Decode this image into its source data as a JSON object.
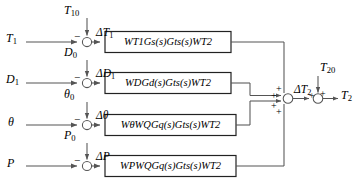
{
  "diagram": {
    "line_color": "#555555",
    "box_border_color": "#222222",
    "text_color": "#000000",
    "rows": [
      {
        "id": "row-t1",
        "input_label": "T",
        "input_sub": "1",
        "reference_label": "T",
        "reference_sub": "10",
        "reference_sign": "−",
        "error_label": "ΔT",
        "error_sub": "1",
        "block_text": "W",
        "block_full": "W T1 G s(s) G ts(s) W T2",
        "block_tokens": [
          {
            "t": "W",
            "s": "T1"
          },
          {
            "t": "G",
            "s": "s"
          },
          {
            "t": "(s)",
            "s": ""
          },
          {
            "t": "G",
            "s": "ts"
          },
          {
            "t": "(s)",
            "s": ""
          },
          {
            "t": "W",
            "s": "T2"
          }
        ],
        "junction_sign_into_sum": "+"
      },
      {
        "id": "row-d1",
        "input_label": "D",
        "input_sub": "1",
        "reference_label": "D",
        "reference_sub": "0",
        "reference_sign": "−",
        "error_label": "ΔD",
        "error_sub": "1",
        "block_full": "W D G d(s) G ts(s) W T2",
        "block_tokens": [
          {
            "t": "W",
            "s": "D"
          },
          {
            "t": "G",
            "s": "d"
          },
          {
            "t": "(s)",
            "s": ""
          },
          {
            "t": "G",
            "s": "ts"
          },
          {
            "t": "(s)",
            "s": ""
          },
          {
            "t": "W",
            "s": "T2"
          }
        ],
        "junction_sign_into_sum": "+"
      },
      {
        "id": "row-theta",
        "input_label": "θ",
        "input_sub": "",
        "reference_label": "θ",
        "reference_sub": "0",
        "reference_sign": "−",
        "error_label": "Δθ",
        "error_sub": "",
        "block_full": "W θ W Q G q(s) G ts(s) W T2",
        "block_tokens": [
          {
            "t": "W",
            "s": "θ"
          },
          {
            "t": "W",
            "s": "Q"
          },
          {
            "t": "G",
            "s": "q"
          },
          {
            "t": "(s)",
            "s": ""
          },
          {
            "t": "G",
            "s": "ts"
          },
          {
            "t": "(s)",
            "s": ""
          },
          {
            "t": "W",
            "s": "T2"
          }
        ],
        "junction_sign_into_sum": "+"
      },
      {
        "id": "row-p",
        "input_label": "P",
        "input_sub": "",
        "reference_label": "P",
        "reference_sub": "0",
        "reference_sign": "−",
        "error_label": "ΔP",
        "error_sub": "",
        "block_full": "W P W Q G q(s) G ts(s) W T2",
        "block_tokens": [
          {
            "t": "W",
            "s": "P"
          },
          {
            "t": "W",
            "s": "Q"
          },
          {
            "t": "G",
            "s": "q"
          },
          {
            "t": "(s)",
            "s": ""
          },
          {
            "t": "G",
            "s": "ts"
          },
          {
            "t": "(s)",
            "s": ""
          },
          {
            "t": "W",
            "s": "T2"
          }
        ],
        "junction_sign_into_sum": "+"
      }
    ],
    "output_stage": {
      "sum_junction_name": "main-summing-junction",
      "sum_output_label": "ΔT",
      "sum_output_sub": "2",
      "bias_label": "T",
      "bias_sub": "20",
      "bias_sign": "+",
      "sum_output_sign": "+",
      "final_output_label": "T",
      "final_output_sub": "2"
    }
  }
}
